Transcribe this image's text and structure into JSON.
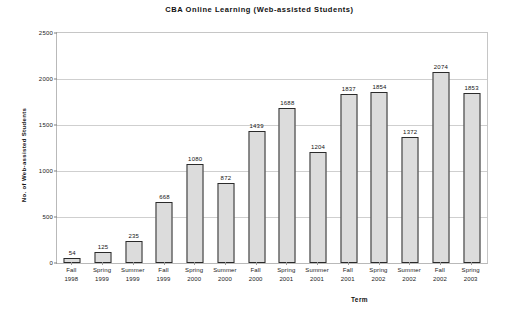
{
  "chart_data": {
    "type": "bar",
    "title": "CBA Online Learning (Web-assisted Students)",
    "xlabel": "Term",
    "ylabel": "No. of Web-assisted Students",
    "ylim": [
      0,
      2500
    ],
    "y_ticks": [
      0,
      500,
      1000,
      1500,
      2000,
      2500
    ],
    "grid": true,
    "legend": "none",
    "categories": [
      "Fall 1998",
      "Spring 1999",
      "Summer 1999",
      "Fall 1999",
      "Spring 2000",
      "Summer 2000",
      "Fall 2000",
      "Spring 2001",
      "Summer 2001",
      "Fall 2001",
      "Spring 2002",
      "Summer 2002",
      "Fall 2002",
      "Spring 2003"
    ],
    "category_lines": [
      [
        "Fall",
        "1998"
      ],
      [
        "Spring",
        "1999"
      ],
      [
        "Summer",
        "1999"
      ],
      [
        "Fall",
        "1999"
      ],
      [
        "Spring",
        "2000"
      ],
      [
        "Summer",
        "2000"
      ],
      [
        "Fall",
        "2000"
      ],
      [
        "Spring",
        "2001"
      ],
      [
        "Summer",
        "2001"
      ],
      [
        "Fall",
        "2001"
      ],
      [
        "Spring",
        "2002"
      ],
      [
        "Summer",
        "2002"
      ],
      [
        "Fall",
        "2002"
      ],
      [
        "Spring",
        "2003"
      ]
    ],
    "values": [
      54,
      125,
      235,
      668,
      1080,
      872,
      1439,
      1688,
      1204,
      1837,
      1854,
      1372,
      2074,
      1853
    ],
    "data_labels": [
      "54",
      "125",
      "235",
      "668",
      "1080",
      "872",
      "1439",
      "1688",
      "1204",
      "1837",
      "1854",
      "1372",
      "2074",
      "1853"
    ],
    "colors": {
      "bar_fill": "#dcdcdc",
      "bar_border": "#2b2b2b",
      "grid": "#cfcfcf",
      "axis": "#b9b9b9",
      "text": "#111111",
      "background": "#ffffff"
    }
  }
}
